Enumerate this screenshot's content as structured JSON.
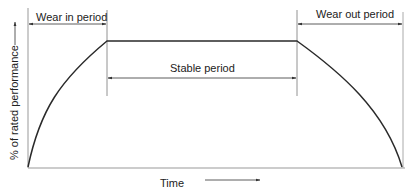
{
  "diagram": {
    "y_axis_label": "% of rated performance",
    "x_axis_label": "Time",
    "periods": {
      "wear_in": "Wear in period",
      "stable": "Stable period",
      "wear_out": "Wear out period"
    },
    "colors": {
      "curve": "#2a2a2a",
      "axis": "#888888",
      "guide": "#555555",
      "text": "#222222"
    }
  }
}
